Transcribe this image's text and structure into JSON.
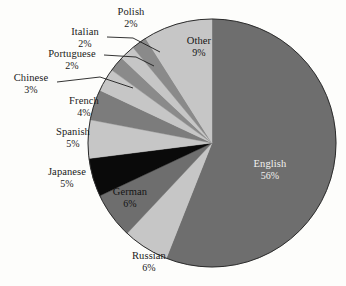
{
  "chart_data": {
    "type": "pie",
    "title": "",
    "legend_position": "none",
    "start_angle_deg": 0,
    "direction": "clockwise",
    "categories": [
      "English",
      "Russian",
      "German",
      "Japanese",
      "Spanish",
      "French",
      "Chinese",
      "Portuguese",
      "Italian",
      "Polish",
      "Other"
    ],
    "values": [
      56,
      6,
      6,
      5,
      5,
      4,
      3,
      2,
      2,
      2,
      9
    ],
    "unit": "%",
    "slices": [
      {
        "label": "English",
        "value": 56,
        "pct_text": "56%",
        "color": "#6e6e6e",
        "label_placement": "inside"
      },
      {
        "label": "Russian",
        "value": 6,
        "pct_text": "6%",
        "color": "#c6c6c6",
        "label_placement": "outside"
      },
      {
        "label": "German",
        "value": 6,
        "pct_text": "6%",
        "color": "#6e6e6e",
        "label_placement": "inside"
      },
      {
        "label": "Japanese",
        "value": 5,
        "pct_text": "5%",
        "color": "#0a0a0a",
        "label_placement": "outside"
      },
      {
        "label": "Spanish",
        "value": 5,
        "pct_text": "5%",
        "color": "#c6c6c6",
        "label_placement": "outside"
      },
      {
        "label": "French",
        "value": 4,
        "pct_text": "4%",
        "color": "#7c7c7c",
        "label_placement": "outside"
      },
      {
        "label": "Chinese",
        "value": 3,
        "pct_text": "3%",
        "color": "#c6c6c6",
        "label_placement": "outside-leader"
      },
      {
        "label": "Portuguese",
        "value": 2,
        "pct_text": "2%",
        "color": "#8a8a8a",
        "label_placement": "outside-leader"
      },
      {
        "label": "Italian",
        "value": 2,
        "pct_text": "2%",
        "color": "#c6c6c6",
        "label_placement": "outside-leader"
      },
      {
        "label": "Polish",
        "value": 2,
        "pct_text": "2%",
        "color": "#8a8a8a",
        "label_placement": "outside"
      },
      {
        "label": "Other",
        "value": 9,
        "pct_text": "9%",
        "color": "#c6c6c6",
        "label_placement": "inside"
      }
    ],
    "background_color": "#fdfdfb",
    "outline_color": "#2b2b2b"
  },
  "labels": {
    "english": {
      "name": "English",
      "pct": "56%"
    },
    "other": {
      "name": "Other",
      "pct": "9%"
    },
    "russian": {
      "name": "Russian",
      "pct": "6%"
    },
    "german": {
      "name": "German",
      "pct": "6%"
    },
    "japanese": {
      "name": "Japanese",
      "pct": "5%"
    },
    "spanish": {
      "name": "Spanish",
      "pct": "5%"
    },
    "french": {
      "name": "French",
      "pct": "4%"
    },
    "chinese": {
      "name": "Chinese",
      "pct": "3%"
    },
    "portuguese": {
      "name": "Portuguese",
      "pct": "2%"
    },
    "italian": {
      "name": "Italian",
      "pct": "2%"
    },
    "polish": {
      "name": "Polish",
      "pct": "2%"
    }
  }
}
